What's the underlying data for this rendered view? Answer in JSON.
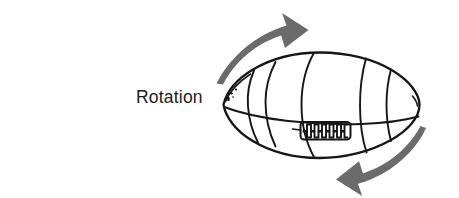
{
  "figure": {
    "title": "Rotation",
    "label": "Rotation",
    "background_color": "#ffffff",
    "ink_color": "#161616",
    "arrow_color": "#6b6b6b",
    "text_color": "#1c1c1c",
    "width": 459,
    "height": 198
  },
  "diagram": {
    "subject_name": "football",
    "subject_description": "hand-drawn american football / rugby ball shown in three-quarter view with seams and laces",
    "arrows": [
      {
        "name": "top-rotation-arrow",
        "direction": "up-right",
        "position": "above-left of ball",
        "color": "#6b6b6b"
      },
      {
        "name": "bottom-rotation-arrow",
        "direction": "down-left",
        "position": "below-right of ball",
        "color": "#6b6b6b"
      }
    ],
    "ball_parts": [
      "outline",
      "equator-seam",
      "vertical-seam-left",
      "vertical-seam-center",
      "vertical-seam-right-inner",
      "vertical-seam-right-outer",
      "laces",
      "tip-stipple"
    ]
  }
}
